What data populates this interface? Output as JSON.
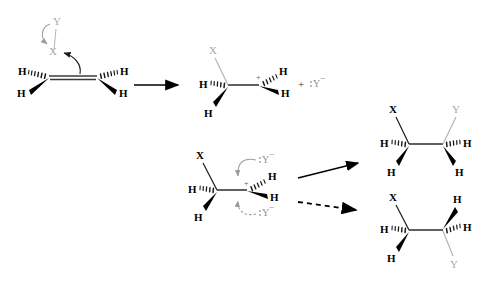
{
  "diagram": {
    "background_color": "#ffffff",
    "colors": {
      "bond_black": "#000000",
      "bond_gray": "#a8a8a8",
      "leaving_group_gray": "#9a9a9a",
      "arrow_black": "#000000",
      "mechanism_arrow_gray": "#9a9a9a"
    }
  },
  "labels": {
    "H": "H",
    "X": "X",
    "Y": "Y",
    "plus_sign": "+",
    "cation_charge": "+",
    "nucleophile": ":Y",
    "nucleophile_charge": "−"
  },
  "structures": {
    "reactant": {
      "name": "alkene-with-leaving-group",
      "substituents": [
        "H",
        "H",
        "H",
        "H",
        "X",
        "Y"
      ],
      "leaving_group": "X",
      "attacking_group": "Y"
    },
    "carbocation_top": {
      "name": "carbocation-intermediate",
      "substituents": [
        "X",
        "H",
        "H",
        "H",
        "H"
      ],
      "charge": "+"
    },
    "byproduct": {
      "name": "leaving-anion",
      "species": ":Y",
      "charge": "−"
    },
    "carbocation_bottom": {
      "name": "carbocation-intermediate-attacked",
      "substituents": [
        "X",
        "H",
        "H",
        "H",
        "H"
      ],
      "charge": "+",
      "nucleophile_top": ":Y",
      "nucleophile_bottom": ":Y"
    },
    "product_top": {
      "name": "product-retention",
      "substituents": [
        "X",
        "H",
        "H",
        "Y",
        "H",
        "H"
      ]
    },
    "product_bottom": {
      "name": "product-inversion",
      "substituents": [
        "X",
        "H",
        "H",
        "H",
        "H",
        "Y"
      ]
    }
  },
  "arrows": {
    "main_reaction": {
      "name": "reaction-arrow",
      "style": "solid"
    },
    "to_product_top": {
      "name": "reaction-arrow-retention",
      "style": "solid"
    },
    "to_product_bottom": {
      "name": "reaction-arrow-inversion",
      "style": "dashed"
    },
    "electron_push_y_to_x": {
      "name": "curved-arrow-y-to-x",
      "style": "curved-gray"
    },
    "electron_push_bond_to_x": {
      "name": "curved-arrow-bond-to-x",
      "style": "curved-black"
    },
    "nucleophile_top_attack": {
      "name": "curved-arrow-nucleophile-top",
      "style": "curved-gray-solid"
    },
    "nucleophile_bottom_attack": {
      "name": "curved-arrow-nucleophile-bottom",
      "style": "curved-gray-dashed"
    }
  }
}
